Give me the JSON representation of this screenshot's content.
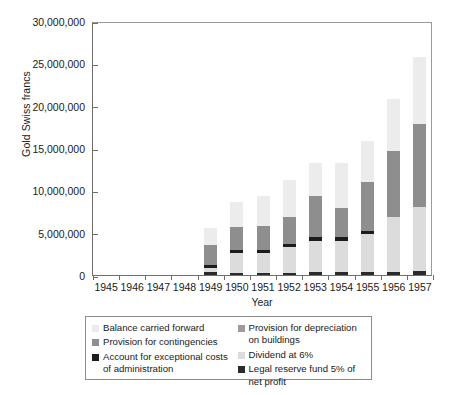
{
  "chart_data": {
    "type": "bar",
    "subtype": "stacked-vertical",
    "title": "",
    "xlabel": "Year",
    "ylabel": "Gold Swiss francs",
    "categories": [
      "1945",
      "1946",
      "1947",
      "1948",
      "1949",
      "1950",
      "1951",
      "1952",
      "1953",
      "1954",
      "1955",
      "1956",
      "1957"
    ],
    "ylim": [
      0,
      30000000
    ],
    "yticks": [
      0,
      5000000,
      10000000,
      15000000,
      20000000,
      25000000,
      30000000
    ],
    "ytick_labels": [
      "0",
      "5,000,000",
      "10,000,000",
      "15,000,000",
      "20,000,000",
      "25,000,000",
      "30,000,000"
    ],
    "grid": false,
    "legend_position": "below-plot",
    "stack_order_bottom_to_top": [
      "Legal reserve fund 5% of net profit",
      "Dividend at 6%",
      "Account for exceptional costs of administration",
      "Provision for contingencies",
      "Provision for depreciation on buildings",
      "Balance carried forward"
    ],
    "series": [
      {
        "name": "Legal reserve fund 5% of net profit",
        "color": "#2b2b2b",
        "values": [
          0,
          0,
          0,
          0,
          330000,
          250000,
          250000,
          260000,
          300000,
          310000,
          330000,
          400000,
          430000
        ]
      },
      {
        "name": "Dividend at 6%",
        "color": "#dcdcdc",
        "values": [
          0,
          0,
          0,
          0,
          470000,
          2300000,
          2300000,
          3000000,
          3700000,
          3700000,
          4500000,
          6400000,
          7600000
        ]
      },
      {
        "name": "Account for exceptional costs of administration",
        "color": "#1c1c1c",
        "values": [
          0,
          0,
          0,
          0,
          400000,
          400000,
          400000,
          400000,
          500000,
          500000,
          400000,
          0,
          0
        ]
      },
      {
        "name": "Provision for contingencies",
        "color": "#8e8e8e",
        "values": [
          0,
          0,
          0,
          0,
          2400000,
          2700000,
          2800000,
          3200000,
          4800000,
          3400000,
          5700000,
          7800000,
          9800000
        ]
      },
      {
        "name": "Provision for depreciation on buildings",
        "color": "#9c9c9c",
        "values": [
          0,
          0,
          0,
          0,
          0,
          0,
          0,
          0,
          0,
          0,
          0,
          0,
          0
        ]
      },
      {
        "name": "Balance carried forward",
        "color": "#ececec",
        "values": [
          0,
          0,
          0,
          0,
          1900000,
          2950000,
          3550000,
          4340000,
          3900000,
          5280000,
          4870000,
          6200000,
          7940000
        ]
      }
    ],
    "totals": [
      0,
      0,
      0,
      0,
      5500000,
      8600000,
      9300000,
      11200000,
      13200000,
      13190000,
      15800000,
      20800000,
      25770000
    ]
  },
  "legend": {
    "left_column": [
      {
        "label": "Balance carried forward",
        "color": "#ececec"
      },
      {
        "label": "Provision for contingencies",
        "color": "#8e8e8e"
      },
      {
        "label": "Account for exceptional costs of administration",
        "color": "#1c1c1c"
      }
    ],
    "right_column": [
      {
        "label": "Provision for depreciation on buildings",
        "color": "#9c9c9c"
      },
      {
        "label": "Dividend at 6%",
        "color": "#dcdcdc"
      },
      {
        "label": "Legal reserve fund 5% of net profit",
        "color": "#2b2b2b"
      }
    ]
  }
}
